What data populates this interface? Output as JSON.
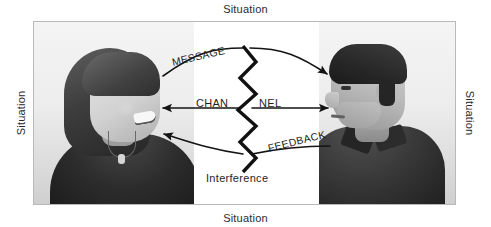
{
  "figure": {
    "type": "communication-model-diagram",
    "title_labels": {
      "top": "Situation",
      "bottom": "Situation",
      "left": "Situation",
      "right": "Situation"
    },
    "center_band_label": "Interference",
    "flows": [
      {
        "id": "message",
        "label": "MESSAGE",
        "direction": "left-to-right",
        "from": "woman",
        "to": "man",
        "curve": "arc-up"
      },
      {
        "id": "channel",
        "label_left": "CHAN",
        "label_right": "NEL",
        "direction": "bidirectional",
        "curve": "straight"
      },
      {
        "id": "feedback",
        "label": "FEEDBACK",
        "direction": "right-to-left",
        "from": "man",
        "to": "woman",
        "curve": "arc-down"
      }
    ],
    "people": [
      {
        "id": "woman",
        "side": "left",
        "facing": "right",
        "description": "smiling woman, long hair, dark top, pendant necklace"
      },
      {
        "id": "man",
        "side": "right",
        "facing": "left",
        "description": "man in profile, short dark hair, dark collared shirt"
      }
    ],
    "interference_marker": "vertical zigzag line through channel",
    "colors": {
      "ink": "#1e1e1e",
      "frame_border": "#b9b9b9",
      "band": "#ffffff",
      "page": "#ffffff"
    }
  }
}
